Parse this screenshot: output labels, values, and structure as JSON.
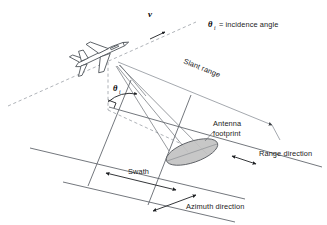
{
  "diagram": {
    "labels": {
      "velocity": "v",
      "theta_symbol": "θ",
      "theta_subscript": "i",
      "incidence_legend_symbol": "θ",
      "incidence_legend_subscript": "i",
      "incidence_legend_text": "= incidence angle",
      "slant_range": "Slant range",
      "antenna_footprint_line1": "Antenna",
      "antenna_footprint_line2": "footprint",
      "range_direction": "Range direction",
      "swath": "Swath",
      "azimuth_direction": "Azimuth direction"
    },
    "colors": {
      "background": "#ffffff",
      "ground_line": "#5a5f66",
      "beam_line": "#6b7076",
      "slant_line": "#8d9299",
      "dashed_flight_path": "#9aa0a6",
      "footprint_fill": "#c2c2c2",
      "footprint_stroke": "#4e5257",
      "arrow": "#1d1f22",
      "text": "#1a1a1a",
      "aircraft_stroke": "#4a4f55"
    },
    "elements": {
      "aircraft": "radar-platform-aircraft",
      "footprint_shape": "ellipse",
      "nadir_line_style": "dashed",
      "flight_path_style": "dashed",
      "right_angle_marker": true
    }
  }
}
